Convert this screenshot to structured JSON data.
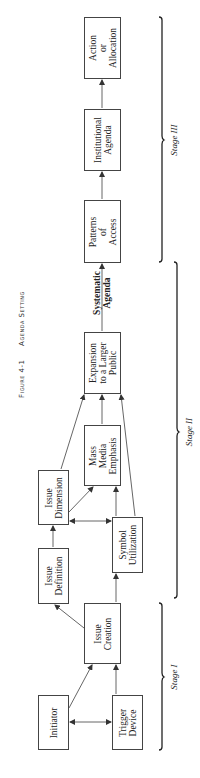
{
  "figure": {
    "number_label": "Figure 4-1",
    "title": "Agenda Setting"
  },
  "boxes": {
    "initiator": "Initiator",
    "trigger_device": "Trigger\nDevice",
    "issue_creation": "Issue\nCreation",
    "issue_definition": "Issue\nDefinition",
    "issue_dimension": "Issue\nDimension",
    "symbol_utilization": "Symbol\nUtilization",
    "mass_media_emphasis": "Mass\nMedia\nEmphasis",
    "expansion": "Expansion\nto a Larger\nPublic",
    "patterns_of_access": "Patterns\nof\nAccess",
    "institutional_agenda": "Institutional\nAgenda",
    "action_or_allocation": "Action\nor\nAllocation"
  },
  "connector_label": "Systematic\nAgenda",
  "stages": {
    "stage1": "Stage I",
    "stage2": "Stage II",
    "stage3": "Stage III"
  },
  "colors": {
    "line": "#444444",
    "text": "#222222",
    "background": "#ffffff"
  }
}
